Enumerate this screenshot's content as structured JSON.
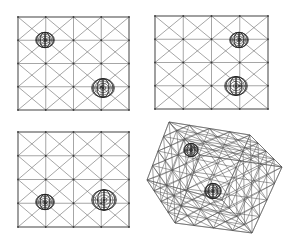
{
  "figure": {
    "width": 297,
    "height": 248,
    "colors": {
      "line": "#6a6a6a",
      "sphere": "#222222",
      "background": "#ffffff"
    }
  },
  "panels": [
    {
      "id": "top-left",
      "type": "grid",
      "x": 18,
      "y": 17,
      "w": 111,
      "h": 93,
      "cols": 4,
      "rows": 4,
      "spheres": [
        {
          "cx": 45,
          "cy": 40,
          "r": 9
        },
        {
          "cx": 103,
          "cy": 88,
          "r": 11
        }
      ]
    },
    {
      "id": "top-right",
      "type": "grid",
      "x": 155,
      "y": 16,
      "w": 113,
      "h": 93,
      "cols": 4,
      "rows": 4,
      "spheres": [
        {
          "cx": 239,
          "cy": 40,
          "r": 9
        },
        {
          "cx": 236,
          "cy": 86,
          "r": 11
        }
      ]
    },
    {
      "id": "bottom-left",
      "type": "grid",
      "x": 18,
      "y": 132,
      "w": 111,
      "h": 95,
      "cols": 4,
      "rows": 4,
      "spheres": [
        {
          "cx": 45,
          "cy": 202,
          "r": 9
        },
        {
          "cx": 104,
          "cy": 200,
          "r": 12
        }
      ]
    },
    {
      "id": "bottom-right",
      "type": "cube",
      "front": [
        [
          169,
          122
        ],
        [
          250,
          135
        ],
        [
          252,
          233
        ],
        [
          175,
          223
        ]
      ],
      "back": [
        [
          190,
          115
        ],
        [
          282,
          130
        ],
        [
          282,
          167
        ],
        [
          147,
          180
        ]
      ],
      "divisions": 4,
      "spheres": [
        {
          "cx": 191,
          "cy": 150,
          "r": 7
        },
        {
          "cx": 213,
          "cy": 191,
          "r": 8
        }
      ]
    }
  ]
}
